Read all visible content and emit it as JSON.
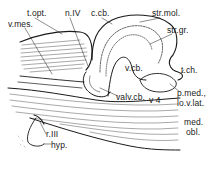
{
  "diagram": {
    "type": "anatomical-sagittal-section",
    "ink_color": "#1a1a1a",
    "background": "#ffffff",
    "labels": [
      {
        "id": "t-opt",
        "text": "t.opt.",
        "x": 27,
        "y": 9
      },
      {
        "id": "n-iv",
        "text": "n.IV",
        "x": 65,
        "y": 9
      },
      {
        "id": "c-cb",
        "text": "c.cb.",
        "x": 91,
        "y": 9
      },
      {
        "id": "str-mol",
        "text": "str.mol.",
        "x": 152,
        "y": 9
      },
      {
        "id": "v-mes",
        "text": "v.mes.",
        "x": 8,
        "y": 20
      },
      {
        "id": "str-gr",
        "text": "str.gr.",
        "x": 167,
        "y": 26
      },
      {
        "id": "v-cb",
        "text": "v.cb.",
        "x": 125,
        "y": 64
      },
      {
        "id": "t-ch",
        "text": "t.ch.",
        "x": 181,
        "y": 66
      },
      {
        "id": "p-med",
        "text": "p.med.,",
        "x": 177,
        "y": 89
      },
      {
        "id": "valv-cb",
        "text": "valv.cb.",
        "x": 116,
        "y": 93
      },
      {
        "id": "v4",
        "text": "v 4",
        "x": 149,
        "y": 96
      },
      {
        "id": "lo-v-lat",
        "text": "lo.v.lat.",
        "x": 177,
        "y": 99
      },
      {
        "id": "med",
        "text": "med.",
        "x": 184,
        "y": 118
      },
      {
        "id": "obl",
        "text": "obl.",
        "x": 186,
        "y": 128
      },
      {
        "id": "r-iii",
        "text": "r.III",
        "x": 46,
        "y": 130
      },
      {
        "id": "hyp",
        "text": "hyp.",
        "x": 51,
        "y": 141
      }
    ]
  }
}
